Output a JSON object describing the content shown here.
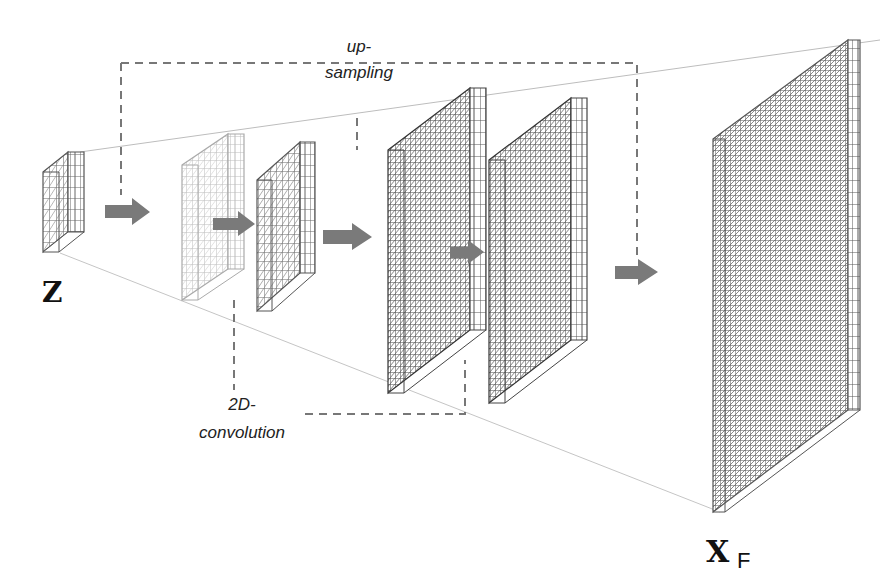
{
  "diagram": {
    "type": "neural-network-generator",
    "labels": {
      "input": "Z",
      "output_main": "X",
      "output_sub": "F",
      "upsampling_line1": "up-",
      "upsampling_line2": "sampling",
      "conv_line1": "2D-",
      "conv_line2": "convolution"
    },
    "colors": {
      "grid_dark": "#555555",
      "grid_light": "#b5b5b5",
      "arrow": "#7a7a7a",
      "dashed": "#777777",
      "projection": "#bdbdbd"
    },
    "tensors": [
      {
        "id": "z",
        "name": "latent-input Z",
        "style": "dark",
        "cols": 4,
        "rows": 8
      },
      {
        "id": "up1",
        "name": "upsampled-1",
        "style": "light",
        "cols": 8,
        "rows": 16
      },
      {
        "id": "conv1",
        "name": "conv-1",
        "style": "dark",
        "cols": 6,
        "rows": 12
      },
      {
        "id": "up2",
        "name": "upsampled-2",
        "style": "dark",
        "cols": 12,
        "rows": 24
      },
      {
        "id": "conv2",
        "name": "conv-2",
        "style": "dark",
        "cols": 12,
        "rows": 24
      },
      {
        "id": "out",
        "name": "output X_F",
        "style": "dark",
        "cols": 24,
        "rows": 48
      }
    ],
    "arrows": 5
  }
}
